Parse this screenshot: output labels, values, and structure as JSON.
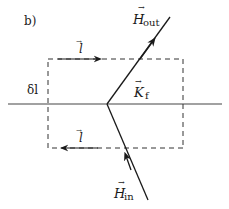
{
  "diagram": {
    "panel_label": "b)",
    "labels": {
      "h_out": {
        "symbol": "H",
        "sub": "out",
        "vector": true
      },
      "h_in": {
        "symbol": "H",
        "sub": "in",
        "vector": true
      },
      "k_f": {
        "symbol": "K",
        "sub": "f",
        "vector": true
      },
      "l_top": {
        "symbol": "l",
        "vector": true
      },
      "l_bottom": {
        "symbol": "l",
        "vector": true
      },
      "delta_l": {
        "text": "δl"
      }
    },
    "elements": {
      "interface_line": "horizontal boundary surface",
      "loop": "dashed rectangular Amperian loop straddling the interface",
      "field_in": "incoming field line below the interface",
      "field_out": "outgoing field line above the interface"
    },
    "colors": {
      "stroke": "#1a1a1a",
      "background": "#ffffff"
    }
  }
}
